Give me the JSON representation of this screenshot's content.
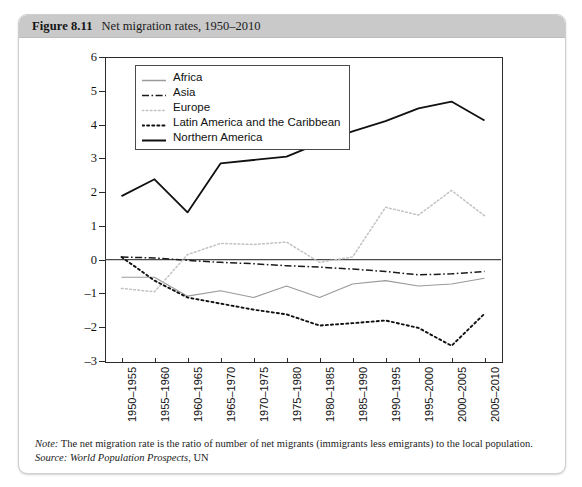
{
  "figure": {
    "number_label": "Figure 8.11",
    "title": "Net migration rates, 1950–2010",
    "note_label": "Note:",
    "note_text": "The net migration rate is the ratio of number of net migrants (immigrants less emigrants) to the local population.",
    "source_label": "Source:",
    "source_italic": "World Population Prospects",
    "source_rest": ", UN"
  },
  "colors": {
    "header_band": "#c9c9c9",
    "frame": "#2a2a2a",
    "africa": "#9a9a9a",
    "asia": "#1a1a1a",
    "europe": "#c2c2c2",
    "latin_america": "#111111",
    "northern_america": "#111111",
    "zero_line": "#4a4a4a"
  },
  "chart_data": {
    "type": "line",
    "title": "Net migration rates, 1950–2010",
    "xlabel": "",
    "ylabel": "",
    "ylim": [
      -3,
      6
    ],
    "yticks": [
      6,
      5,
      4,
      3,
      2,
      1,
      0,
      -1,
      -2,
      -3
    ],
    "grid": false,
    "legend_position": "top-left inside",
    "categories": [
      "1950–1955",
      "1955–1960",
      "1960–1965",
      "1965–1970",
      "1970–1975",
      "1975–1980",
      "1980–1985",
      "1985–1990",
      "1990–1995",
      "1995–2000",
      "2000–2005",
      "2005–2010"
    ],
    "series": [
      {
        "name": "Africa",
        "style": "solid",
        "color": "#9a9a9a",
        "width": 1.1,
        "values": [
          -0.52,
          -0.52,
          -1.08,
          -0.92,
          -1.12,
          -0.78,
          -1.12,
          -0.72,
          -0.62,
          -0.78,
          -0.72,
          -0.55
        ]
      },
      {
        "name": "Asia",
        "style": "dashdot",
        "color": "#1a1a1a",
        "width": 1.5,
        "values": [
          0.08,
          0.05,
          -0.02,
          -0.08,
          -0.12,
          -0.18,
          -0.22,
          -0.28,
          -0.35,
          -0.45,
          -0.42,
          -0.35
        ]
      },
      {
        "name": "Europe",
        "style": "dotted",
        "color": "#c2c2c2",
        "width": 1.5,
        "values": [
          -0.85,
          -0.95,
          0.15,
          0.48,
          0.45,
          0.52,
          -0.08,
          0.08,
          1.55,
          1.32,
          2.05,
          1.3
        ]
      },
      {
        "name": "Latin America and the Caribbean",
        "style": "dotted",
        "color": "#111111",
        "width": 1.9,
        "values": [
          0.08,
          -0.62,
          -1.12,
          -1.3,
          -1.48,
          -1.62,
          -1.95,
          -1.88,
          -1.8,
          -2.02,
          -2.55,
          -1.6
        ]
      },
      {
        "name": "Northern America",
        "style": "solid",
        "color": "#111111",
        "width": 1.8,
        "values": [
          1.88,
          2.38,
          1.4,
          2.85,
          2.95,
          3.05,
          3.45,
          3.8,
          4.1,
          4.48,
          4.68,
          4.12
        ]
      }
    ]
  }
}
